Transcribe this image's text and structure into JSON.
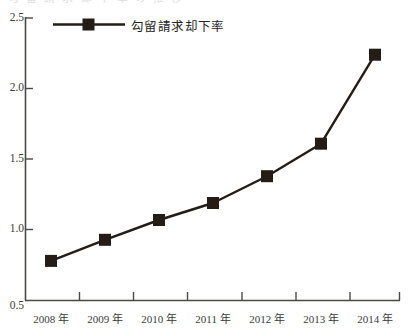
{
  "page": {
    "top_clipped_text": "勾 留 請 求 却 下 率 の 推 移",
    "background_color": "#ffffff"
  },
  "legend": {
    "entries": [
      {
        "label": "勾留請求却下率",
        "marker": "square-marker",
        "color": "#241c17"
      }
    ]
  },
  "axes": {
    "y_tick_labels": [
      "2.5",
      "2.0",
      "1.5",
      "1.0",
      "0.5"
    ],
    "x_tick_labels": [
      "2008 年",
      "2009 年",
      "2010 年",
      "2011 年",
      "2012 年",
      "2013 年",
      "2014 年"
    ],
    "axis_color": "#4a4a46"
  },
  "chart_data": {
    "type": "line",
    "title": "",
    "xlabel": "",
    "ylabel": "",
    "categories": [
      "2008 年",
      "2009 年",
      "2010 年",
      "2011 年",
      "2012 年",
      "2013 年",
      "2014 年"
    ],
    "x": [
      2008,
      2009,
      2010,
      2011,
      2012,
      2013,
      2014
    ],
    "series": [
      {
        "name": "勾留請求却下率",
        "values": [
          0.78,
          0.93,
          1.07,
          1.19,
          1.38,
          1.61,
          2.24
        ],
        "color": "#241c17",
        "marker": "square",
        "line_width": 2.4
      }
    ],
    "ylim": [
      0.5,
      2.5
    ],
    "yticks": [
      0.5,
      1.0,
      1.5,
      2.0,
      2.5
    ],
    "xlim": [
      2007.6,
      2014.6
    ],
    "grid": false,
    "legend_position": "top-left",
    "spines": [
      "left",
      "bottom"
    ]
  }
}
